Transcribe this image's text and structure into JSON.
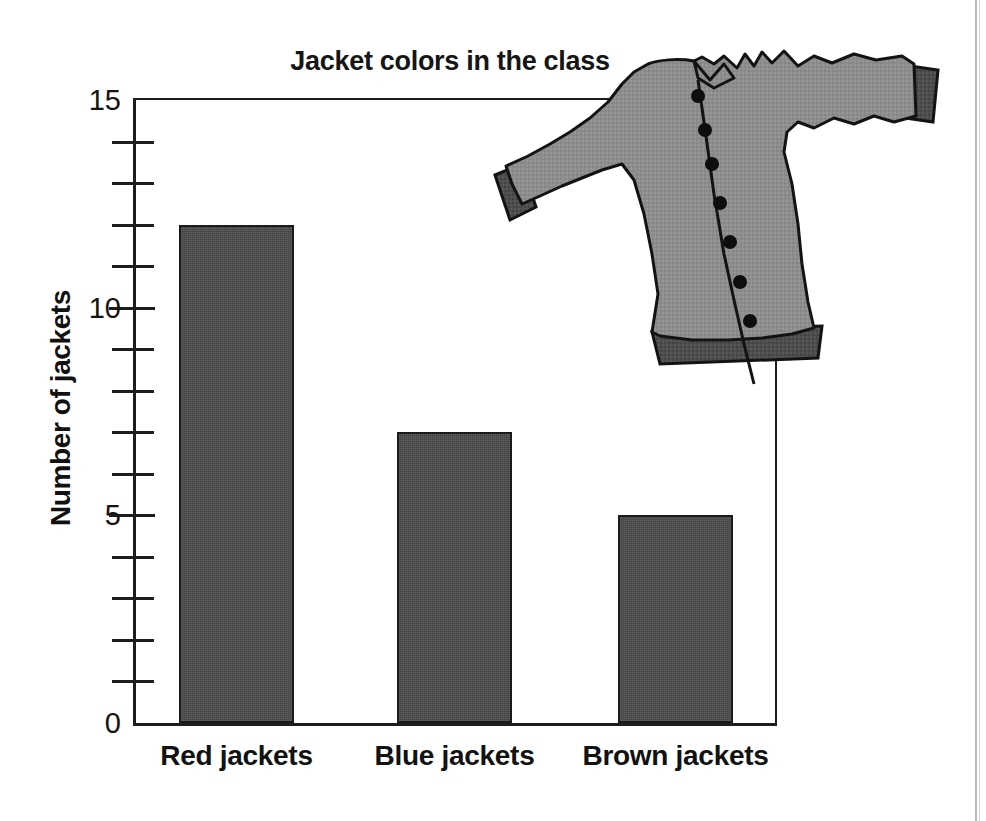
{
  "chart_data": {
    "type": "bar",
    "title": "Jacket colors in the class",
    "xlabel": "",
    "ylabel": "Number of jackets",
    "categories": [
      "Red jackets",
      "Blue jackets",
      "Brown jackets"
    ],
    "values": [
      12,
      7,
      5
    ],
    "ylim": [
      0,
      15
    ],
    "ytick_labels": [
      "0",
      "5",
      "10",
      "15"
    ],
    "ytick_values": [
      0,
      5,
      10,
      15
    ],
    "minor_tick_step": 1,
    "grid": false,
    "legend": false,
    "bar_color": "#4b4b4b",
    "bar_edge_color": "#1a1a1a",
    "axis_color": "#1d1d1d",
    "background": "#ffffff"
  },
  "illustration": {
    "name": "jacket-illustration",
    "description": "Gray jacket with seven buttons",
    "body_color": "#8d8d8d",
    "trim_color": "#4d4d4d",
    "outline_color": "#131313",
    "button_color": "#0d0d0d",
    "button_count": 7
  }
}
